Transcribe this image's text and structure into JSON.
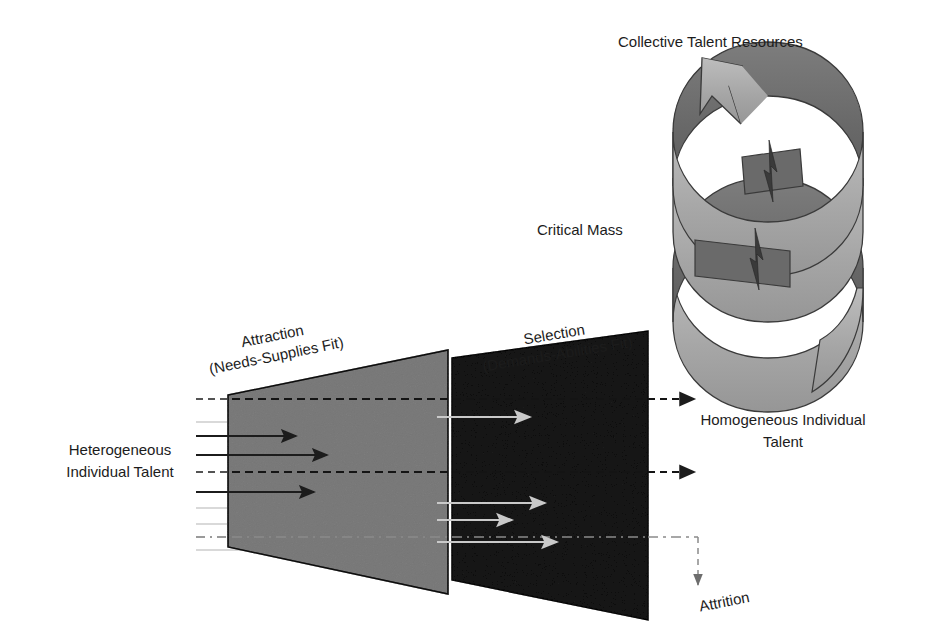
{
  "diagram": {
    "title_implicit": "Attraction-Selection-Attrition talent funnel with collective talent resources spiral",
    "labels": {
      "collective_talent_resources": "Collective Talent Resources",
      "critical_mass": "Critical Mass",
      "attraction_line1": "Attraction",
      "attraction_line2": "(Needs-Supplies Fit)",
      "selection_line1": "Selection",
      "selection_line2": "(Demands-Abilities Fit)",
      "heterogeneous_line1": "Heterogeneous",
      "heterogeneous_line2": "Individual Talent",
      "homogeneous_line1": "Homogeneous Individual",
      "homogeneous_line2": "Talent",
      "attrition": "Attrition"
    },
    "colors": {
      "light_gray_fill": "#b0b0b0",
      "dark_gray_fill": "#4a4a4a",
      "spiral_light": "#a9a9a9",
      "spiral_dark": "#6e6e6e",
      "outline": "#2b2b2b",
      "text": "#1c1c1c",
      "arrow_dark": "#1c1c1c",
      "arrow_light": "#c8c8c8",
      "thin_line": "#9a9a9a",
      "background": "#ffffff"
    },
    "stages": [
      {
        "name": "attraction",
        "fill": "#b0b0b0",
        "shape": "trapezoid-expanding-right"
      },
      {
        "name": "selection",
        "fill": "#4a4a4a",
        "shape": "trapezoid-expanding-right"
      }
    ],
    "flow": {
      "input_arrow_count": 3,
      "input_arrow_color": "#1c1c1c",
      "mid_arrow_count": 4,
      "mid_arrow_color": "#c8c8c8",
      "output_arrow_count": 2,
      "output_arrow_style": "dashed",
      "attrition_arrow_style": "dashed-down"
    },
    "spiral": {
      "turns": 2.5,
      "has_arrowhead": true,
      "arrowhead_position": "top-left",
      "crossover_spike_count": 2
    }
  }
}
